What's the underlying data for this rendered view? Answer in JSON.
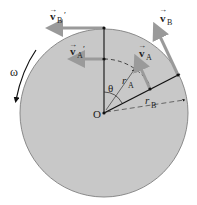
{
  "diagram": {
    "labels": {
      "vB": "v",
      "vB_sub": "B",
      "vA": "v",
      "vA_sub": "A",
      "vBprime": "v",
      "vBprime_sub": "B",
      "vAprime": "v",
      "vAprime_sub": "A",
      "prime": "′",
      "omega": "ω",
      "theta": "θ",
      "origin": "O",
      "rA": "r",
      "rA_sub": "A",
      "rB": "r",
      "rB_sub": "B",
      "vec": "→"
    },
    "colors": {
      "disk_fill": "#c8c8c8",
      "disk_edge": "#8a8a8a",
      "arrow": "#9a9a9a",
      "line": "#111111"
    }
  }
}
